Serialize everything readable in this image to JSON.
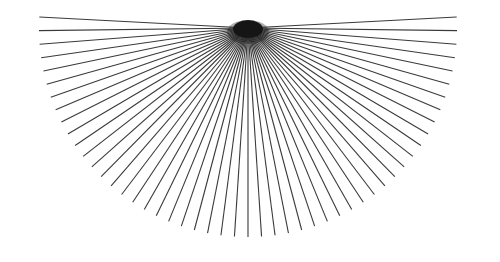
{
  "figure": {
    "type": "line-art"
  },
  "canvas": {
    "width": 500,
    "height": 262,
    "background_color": "#ffffff"
  },
  "chart_data": {
    "type": "line",
    "xlabel": "",
    "ylabel": "",
    "grid": false,
    "legend": "none",
    "xlim": [
      0,
      500
    ],
    "ylim": [
      0,
      262
    ],
    "geometry": {
      "vertex_x": 248,
      "vertex_y": 28,
      "radius": 209,
      "angle_start_deg": -3,
      "angle_end_deg": 183,
      "ray_count": 51,
      "angle_step_deg": 3.72,
      "angle_reference": "degrees measured counterclockwise from positive x-axis, rays drawn into the lower half plane"
    },
    "style": {
      "stroke_color": "#3a3a3a",
      "stroke_width": 1.1,
      "hub_color": "#151515",
      "hub_radius_x": 15,
      "hub_radius_y": 9
    }
  },
  "labels": {
    "vertex_name": "convergence-point",
    "fan_name": "radial-ray-fan"
  }
}
